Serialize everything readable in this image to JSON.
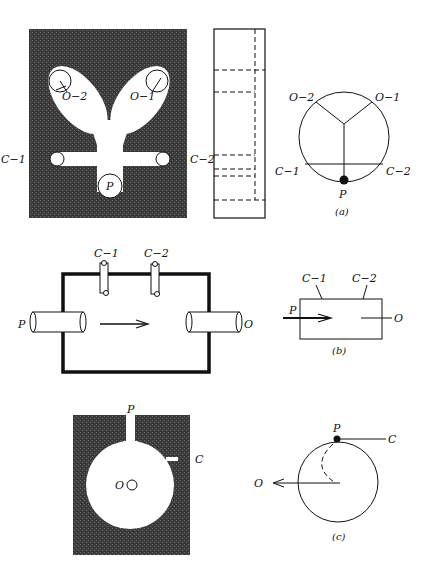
{
  "figure": {
    "part_a": {
      "caption": "(a)",
      "block_labels": {
        "outlet_2": "O−2",
        "outlet_1": "O−1",
        "cavity_1": "C−1",
        "cavity_2": "C−2",
        "port": "P"
      },
      "symbol_labels": {
        "outlet_2": "O−2",
        "outlet_1": "O−1",
        "cavity_1": "C−1",
        "cavity_2": "C−2",
        "port": "P"
      }
    },
    "part_b": {
      "caption": "(b)",
      "block_labels": {
        "cavity_1": "C−1",
        "cavity_2": "C−2",
        "port": "P",
        "outlet": "O"
      },
      "symbol_labels": {
        "cavity_1": "C−1",
        "cavity_2": "C−2",
        "port": "P",
        "outlet": "O"
      }
    },
    "part_c": {
      "caption": "(c)",
      "block_labels": {
        "port": "P",
        "cavity": "C",
        "outlet": "O"
      },
      "symbol_labels": {
        "port": "P",
        "cavity": "C",
        "outlet": "O"
      }
    },
    "colors": {
      "fill_dark": "#3a3a3a",
      "line": "#111111",
      "background": "#ffffff"
    }
  }
}
